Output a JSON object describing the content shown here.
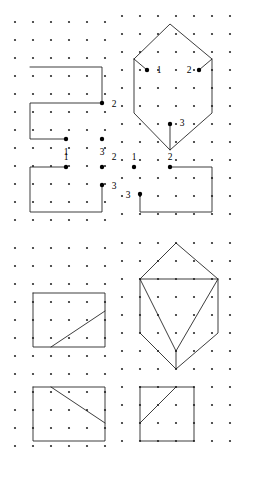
{
  "figure": {
    "kind": "dot-grid-geometric-figures",
    "width": 259,
    "height": 477,
    "background_color": "#ffffff",
    "line_color": "#1a1a1a",
    "dot_color": "#2b2b2b",
    "vertex_color": "#000000",
    "grid": {
      "spacing_x": 18,
      "spacing_y": 18,
      "dot_radius": 1.1,
      "vertex_radius": 2.2,
      "panels": [
        {
          "name": "top-left-grid",
          "origin_x": 15,
          "origin_y": 22,
          "cols": 6,
          "rows": 12
        },
        {
          "name": "top-right-grid",
          "origin_x": 122,
          "origin_y": 16,
          "cols": 7,
          "rows": 12
        },
        {
          "name": "bottom-left-grid",
          "origin_x": 15,
          "origin_y": 248,
          "cols": 6,
          "rows": 12
        },
        {
          "name": "bottom-right-grid",
          "origin_x": 122,
          "origin_y": 243,
          "cols": 7,
          "rows": 12
        }
      ]
    },
    "shapes": [
      {
        "name": "top-left-partial-square",
        "panel": "top-left",
        "description": "three-sided open square outline, opening on right-lower side",
        "polylines": [
          [
            [
              30,
              67
            ],
            [
              102,
              67
            ],
            [
              102,
              103
            ],
            [
              30,
              103
            ],
            [
              30,
              139
            ],
            [
              66,
              139
            ]
          ]
        ],
        "vertices": [
          {
            "id": "2",
            "x": 102,
            "y": 103,
            "label_x": 114,
            "label_y": 107
          },
          {
            "id": "1",
            "x": 66,
            "y": 139,
            "label_x": 66,
            "label_y": 155
          },
          {
            "id": "3",
            "x": 102,
            "y": 139,
            "label_x": 102,
            "label_y": 155
          }
        ]
      },
      {
        "name": "top-right-hexagon-cube-outline",
        "panel": "top-right",
        "description": "hexagon outline (cube silhouette) with three marked interior vertices and short stub edges",
        "polylines": [
          [
            [
              134,
              59
            ],
            [
              170,
              24
            ],
            [
              212,
              59
            ],
            [
              212,
              113
            ],
            [
              170,
              150
            ],
            [
              134,
              113
            ],
            [
              134,
              59
            ]
          ],
          [
            [
              134,
              59
            ],
            [
              147,
              70
            ]
          ],
          [
            [
              212,
              59
            ],
            [
              199,
              70
            ]
          ],
          [
            [
              170,
              150
            ],
            [
              170,
              124
            ]
          ]
        ],
        "vertices": [
          {
            "id": "1",
            "x": 147,
            "y": 70,
            "label_x": 159,
            "label_y": 73
          },
          {
            "id": "2",
            "x": 199,
            "y": 70,
            "label_x": 189,
            "label_y": 73
          },
          {
            "id": "3",
            "x": 170,
            "y": 124,
            "label_x": 182,
            "label_y": 126
          }
        ]
      },
      {
        "name": "mid-left-partial-square",
        "panel": "top-left",
        "description": "three-sided open square outline, opening on upper-right side",
        "polylines": [
          [
            [
              66,
              167
            ],
            [
              30,
              167
            ],
            [
              30,
              203
            ],
            [
              30,
              212
            ],
            [
              102,
              212
            ],
            [
              102,
              194
            ],
            [
              102,
              185
            ]
          ]
        ],
        "vertices": [
          {
            "id": "1",
            "x": 66,
            "y": 167,
            "label_x": 66,
            "label_y": 160
          },
          {
            "id": "2",
            "x": 102,
            "y": 167,
            "label_x": 114,
            "label_y": 160
          },
          {
            "id": "3",
            "x": 102,
            "y": 185,
            "label_x": 114,
            "label_y": 189
          }
        ]
      },
      {
        "name": "mid-right-partial-square",
        "panel": "top-right",
        "description": "three-sided open square outline, opening on upper-left side",
        "polylines": [
          [
            [
              170,
              167
            ],
            [
              212,
              167
            ],
            [
              212,
              212
            ],
            [
              140,
              212
            ],
            [
              140,
              194
            ]
          ]
        ],
        "vertices": [
          {
            "id": "1",
            "x": 134,
            "y": 167,
            "label_x": 134,
            "label_y": 160
          },
          {
            "id": "2",
            "x": 170,
            "y": 167,
            "label_x": 170,
            "label_y": 160
          },
          {
            "id": "3",
            "x": 140,
            "y": 194,
            "label_x": 128,
            "label_y": 198
          }
        ]
      },
      {
        "name": "lower-top-left-square-with-diagonal",
        "panel": "bottom-left",
        "description": "closed square with a diagonal line rising from the bottom edge to the right edge",
        "polylines": [
          [
            [
              33,
              293
            ],
            [
              105,
              293
            ],
            [
              105,
              347
            ],
            [
              33,
              347
            ],
            [
              33,
              293
            ]
          ],
          [
            [
              51,
              347
            ],
            [
              105,
              311
            ]
          ]
        ],
        "vertices": []
      },
      {
        "name": "lower-top-right-cube-with-inner-triangle",
        "panel": "bottom-right",
        "description": "hexagonal cube silhouette containing an inverted triangle (front-face meeting lines) and a short bottom stub",
        "polylines": [
          [
            [
              140,
              279
            ],
            [
              176,
              243
            ],
            [
              218,
              279
            ],
            [
              218,
              333
            ],
            [
              176,
              369
            ],
            [
              140,
              333
            ],
            [
              140,
              279
            ]
          ],
          [
            [
              140,
              279
            ],
            [
              218,
              279
            ]
          ],
          [
            [
              140,
              279
            ],
            [
              176,
              351
            ]
          ],
          [
            [
              218,
              279
            ],
            [
              176,
              351
            ]
          ],
          [
            [
              176,
              351
            ],
            [
              176,
              369
            ]
          ]
        ],
        "vertices": []
      },
      {
        "name": "lower-bottom-left-square-with-diagonal",
        "panel": "bottom-left",
        "description": "closed square with a diagonal descending from top edge to right edge",
        "polylines": [
          [
            [
              33,
              387
            ],
            [
              105,
              387
            ],
            [
              105,
              441
            ],
            [
              33,
              441
            ],
            [
              33,
              387
            ]
          ],
          [
            [
              51,
              387
            ],
            [
              105,
              423
            ]
          ]
        ],
        "vertices": []
      },
      {
        "name": "lower-bottom-right-square-with-diagonal",
        "panel": "bottom-right",
        "description": "closed square with a diagonal rising from left edge to top edge",
        "polylines": [
          [
            [
              140,
              387
            ],
            [
              194,
              387
            ],
            [
              194,
              441
            ],
            [
              140,
              441
            ],
            [
              140,
              387
            ]
          ],
          [
            [
              140,
              423
            ],
            [
              176,
              387
            ]
          ]
        ],
        "vertices": []
      }
    ]
  }
}
